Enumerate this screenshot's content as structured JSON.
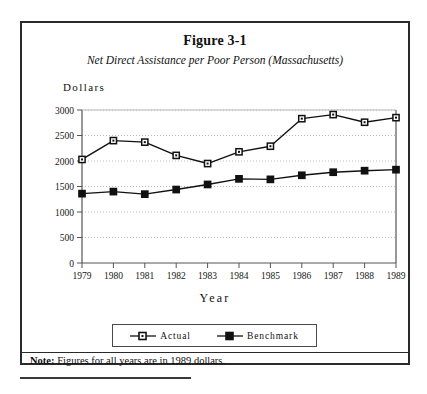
{
  "figure": {
    "title": "Figure 3-1",
    "subtitle": "Net Direct Assistance per Poor Person (Massachusetts)",
    "note_label": "Note:",
    "note_text": " Figures for all years are in 1989 dollars."
  },
  "chart_data": {
    "type": "line",
    "title": "Figure 3-1",
    "subtitle": "Net Direct Assistance per Poor Person (Massachusetts)",
    "xlabel": "Year",
    "ylabel": "Dollars",
    "categories": [
      "1979",
      "1980",
      "1981",
      "1982",
      "1983",
      "1984",
      "1985",
      "1986",
      "1987",
      "1988",
      "1989"
    ],
    "x": [
      1979,
      1980,
      1981,
      1982,
      1983,
      1984,
      1985,
      1986,
      1987,
      1988,
      1989
    ],
    "xlim": [
      1979,
      1989
    ],
    "ylim": [
      0,
      3000
    ],
    "yticks": [
      0,
      500,
      1000,
      1500,
      2000,
      2500,
      3000
    ],
    "ytick_labels": [
      "0",
      "500",
      "1000",
      "1500",
      "2000",
      "2500",
      "3000"
    ],
    "grid": "horizontal-dotted",
    "legend_position": "below-plot",
    "series": [
      {
        "name": "Actual",
        "marker": "open-square",
        "values": [
          2030,
          2400,
          2370,
          2110,
          1950,
          2180,
          2290,
          2830,
          2910,
          2760,
          2850
        ]
      },
      {
        "name": "Benchmark",
        "marker": "filled-square",
        "values": [
          1360,
          1400,
          1350,
          1440,
          1540,
          1650,
          1640,
          1720,
          1780,
          1810,
          1830
        ]
      }
    ],
    "colors": {
      "line": "#111111",
      "grid": "#b9b9b9",
      "axis": "#555555",
      "background": "#ffffff"
    }
  },
  "legend": {
    "items": [
      {
        "label": "Actual"
      },
      {
        "label": "Benchmark"
      }
    ]
  }
}
